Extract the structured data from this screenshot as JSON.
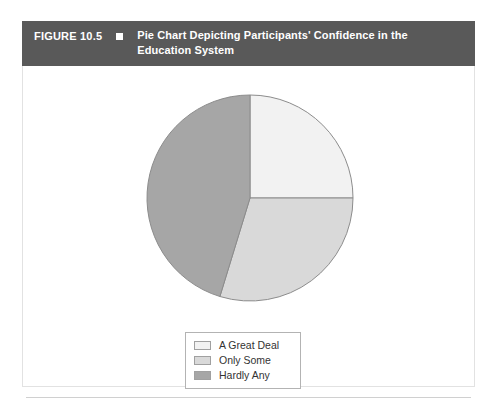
{
  "figure": {
    "number": "FIGURE 10.5",
    "marker_icon": "square-marker-icon",
    "title": "Pie Chart Depicting Participants' Confidence in the Education System",
    "header_bg": "#595959",
    "header_text_color": "#ffffff"
  },
  "chart_data": {
    "type": "pie",
    "title": "Pie Chart Depicting Participants' Confidence in the Education System",
    "xlabel": "",
    "ylabel": "",
    "legend_position": "bottom-center",
    "grid": false,
    "start_angle_deg": 0,
    "direction": "clockwise",
    "categories": [
      "A Great Deal",
      "Only Some",
      "Hardly Any"
    ],
    "values": [
      25,
      45,
      30
    ],
    "slices": [
      {
        "label": "A Great Deal",
        "percent": 25,
        "start_angle_deg": 0,
        "end_angle_deg": 90,
        "color": "#f2f2f2"
      },
      {
        "label": "Only Some",
        "percent": 45,
        "start_angle_deg": 90,
        "end_angle_deg": 197,
        "color": "#d9d9d9"
      },
      {
        "label": "Hardly Any",
        "percent": 30,
        "start_angle_deg": 197,
        "end_angle_deg": 360,
        "color": "#a6a6a6"
      }
    ],
    "geometry": {
      "center_x": 228,
      "center_y": 132,
      "radius": 103
    },
    "stroke_color": "#8c8c8c"
  },
  "legend": {
    "border_color": "#b3b3b3",
    "background": "#ffffff",
    "items": [
      {
        "label": "A Great Deal",
        "color": "#f2f2f2"
      },
      {
        "label": "Only Some",
        "color": "#d9d9d9"
      },
      {
        "label": "Hardly Any",
        "color": "#a6a6a6"
      }
    ]
  }
}
